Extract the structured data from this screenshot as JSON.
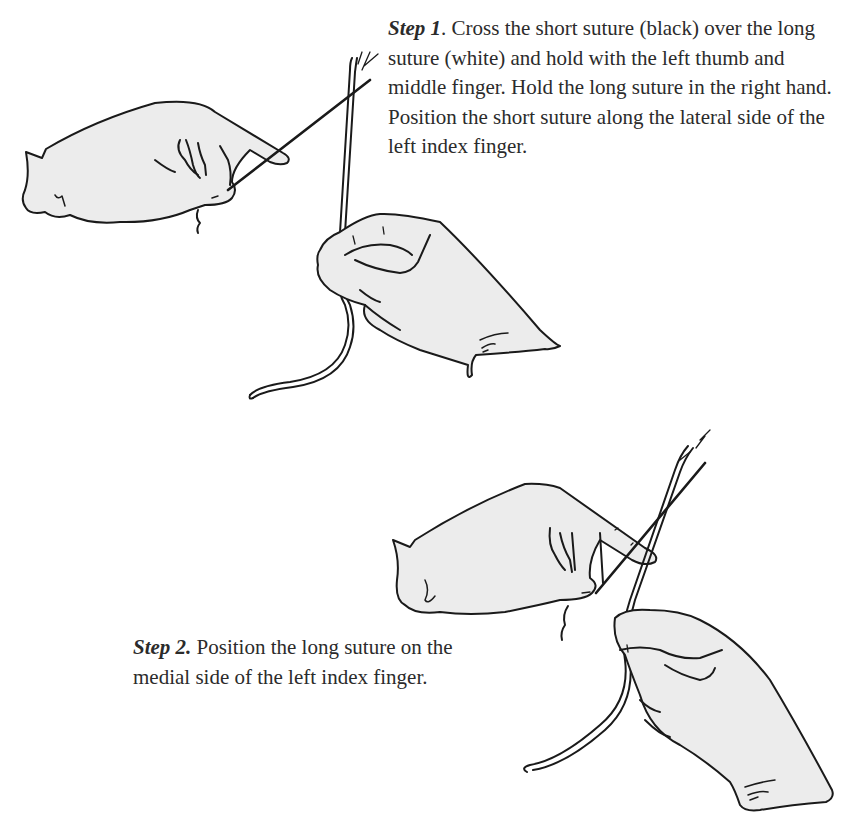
{
  "colors": {
    "background": "#ffffff",
    "outline": "#1a1a1a",
    "glove_fill": "#ececec",
    "text": "#2b2b2b"
  },
  "steps": [
    {
      "label": "Step 1",
      "text": ". Cross the short suture (black) over the long suture (white) and hold with the left thumb and middle finger. Hold the long suture in the right hand. Position the short suture along the lateral side of the left index finger."
    },
    {
      "label": "Step 2.",
      "text": " Position the long suture on the medial side of the left index finger."
    }
  ],
  "illustrations": [
    {
      "name": "step-1-hands",
      "depicts": "left gloved hand pinching black short suture, right gloved hand holding white long suture vertically"
    },
    {
      "name": "step-2-hands",
      "depicts": "left gloved hand with long white suture on medial side of index finger, right hand holding long suture below"
    }
  ]
}
